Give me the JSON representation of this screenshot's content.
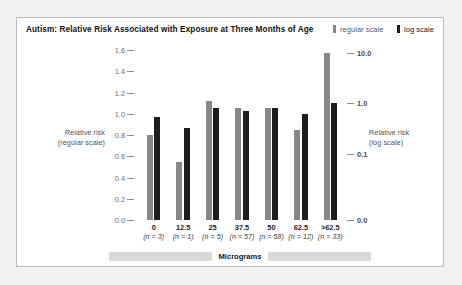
{
  "chart_title": "Autism: Relative Risk Associated with Exposure at Three Months of Age",
  "legend": {
    "items": [
      {
        "label": "regular scale",
        "color": "#87878a",
        "swatch_icon": "bar-swatch-icon"
      },
      {
        "label": "log scale",
        "color": "#1d1d1d",
        "swatch_icon": "bar-swatch-icon"
      }
    ]
  },
  "axes": {
    "left_title_line1": "Relative risk",
    "left_title_line2": "(regular scale)",
    "right_title_line1": "Relative risk",
    "right_title_line2": "(log scale)",
    "left_ticks": [
      "0.0",
      "0.2",
      "0.4",
      "0.6",
      "0.8",
      "1.0",
      "1.2",
      "1.4",
      "1.6"
    ],
    "right_ticks": [
      "0.0",
      "0.1",
      "1.0",
      "10.0"
    ],
    "x_band_label": "Micrograms"
  },
  "chart_data": {
    "type": "bar",
    "title": "Autism: Relative Risk Associated with Exposure at Three Months of Age",
    "xlabel": "Micrograms",
    "ylabel": "Relative risk (regular scale)",
    "y2label": "Relative risk (log scale)",
    "ylim": [
      0.0,
      1.6
    ],
    "yticks": [
      0.0,
      0.2,
      0.4,
      0.6,
      0.8,
      1.0,
      1.2,
      1.4,
      1.6
    ],
    "y2ticks": [
      0.0,
      0.1,
      1.0,
      10.0
    ],
    "grid": false,
    "legend_position": "top-right",
    "categories": [
      "0",
      "12.5",
      "25",
      "37.5",
      "50",
      "62.5",
      ">62.5"
    ],
    "category_counts": [
      "(n = 3)",
      "(n = 1)",
      "(n = 5)",
      "(n = 57)",
      "(n = 58)",
      "(n = 12)",
      "(n = 33)"
    ],
    "n": [
      3,
      1,
      5,
      57,
      58,
      12,
      33
    ],
    "series": [
      {
        "name": "regular scale",
        "color": "#87878a",
        "values": [
          0.8,
          0.55,
          1.12,
          1.05,
          1.05,
          0.85,
          1.57
        ]
      },
      {
        "name": "log scale",
        "color": "#1d1d1d",
        "values": [
          0.97,
          0.87,
          1.05,
          1.03,
          1.05,
          1.0,
          1.1
        ]
      }
    ]
  }
}
